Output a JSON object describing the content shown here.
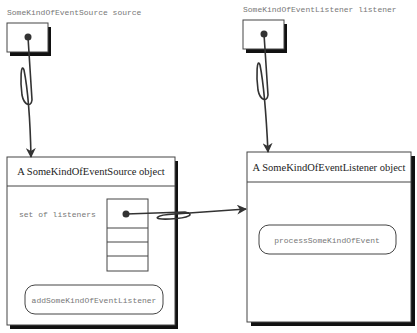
{
  "variables": {
    "source_label": "SomeKindOfEventSource source",
    "listener_label": "SomeKindOfEventListener listener"
  },
  "source_object": {
    "title": "A SomeKindOfEventSource object",
    "field_label": "set of listeners",
    "method": "addSomeKindOfEventListener"
  },
  "listener_object": {
    "title": "A SomeKindOfEventListener object",
    "method": "processSomeKindOfEvent"
  }
}
